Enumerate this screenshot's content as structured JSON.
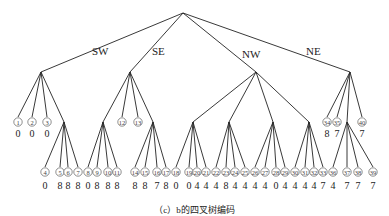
{
  "caption": "（c）b的四叉树编码",
  "root": {
    "x": 183,
    "y": 13
  },
  "level1": [
    {
      "label": "SW",
      "x": 41,
      "y": 72,
      "lx": 92,
      "ly": 55
    },
    {
      "label": "SE",
      "x": 130,
      "y": 72,
      "lx": 152,
      "ly": 55
    },
    {
      "label": "NW",
      "x": 256,
      "y": 72,
      "lx": 242,
      "ly": 58
    },
    {
      "label": "NE",
      "x": 350,
      "y": 72,
      "lx": 306,
      "ly": 55
    }
  ],
  "level2": [
    {
      "parent": 0,
      "id": "1",
      "x": 18,
      "y": 122,
      "value": "0"
    },
    {
      "parent": 0,
      "id": "2",
      "x": 32,
      "y": 122,
      "value": "0"
    },
    {
      "parent": 0,
      "id": "3",
      "x": 47,
      "y": 122,
      "value": "0"
    },
    {
      "parent": 0,
      "id": null,
      "x": 64,
      "y": 122,
      "internal": 0
    },
    {
      "parent": 1,
      "id": null,
      "x": 103,
      "y": 122,
      "internal": 1
    },
    {
      "parent": 1,
      "id": "12",
      "x": 122,
      "y": 122,
      "value": ""
    },
    {
      "parent": 1,
      "id": "13",
      "x": 138,
      "y": 122,
      "value": ""
    },
    {
      "parent": 1,
      "id": null,
      "x": 153,
      "y": 122,
      "internal": 2
    },
    {
      "parent": 2,
      "id": null,
      "x": 193,
      "y": 122,
      "internal": 3
    },
    {
      "parent": 2,
      "id": null,
      "x": 229,
      "y": 122,
      "internal": 4
    },
    {
      "parent": 2,
      "id": null,
      "x": 273,
      "y": 122,
      "internal": 5
    },
    {
      "parent": 2,
      "id": null,
      "x": 309,
      "y": 122,
      "internal": 6
    },
    {
      "parent": 3,
      "id": "34",
      "x": 327,
      "y": 122,
      "value": "8"
    },
    {
      "parent": 3,
      "id": "35",
      "x": 337,
      "y": 122,
      "value": "7"
    },
    {
      "parent": 3,
      "id": null,
      "x": 347,
      "y": 122,
      "internal": 7
    },
    {
      "parent": 3,
      "id": "40",
      "x": 362,
      "y": 122,
      "value": "7"
    }
  ],
  "level3_groups": [
    {
      "parent_x": 64,
      "leaves": [
        {
          "id": "4",
          "x": 45,
          "value": "0"
        },
        {
          "id": "5",
          "x": 60,
          "value": "8"
        },
        {
          "id": "6",
          "x": 68,
          "value": "8"
        },
        {
          "id": "7",
          "x": 78,
          "value": "8"
        }
      ]
    },
    {
      "parent_x": 103,
      "leaves": [
        {
          "id": "8",
          "x": 88,
          "value": "0"
        },
        {
          "id": "9",
          "x": 97,
          "value": "8"
        },
        {
          "id": "10",
          "x": 108,
          "value": "8"
        },
        {
          "id": "11",
          "x": 117,
          "value": "8"
        }
      ]
    },
    {
      "parent_x": 153,
      "leaves": [
        {
          "id": "14",
          "x": 135,
          "value": "8"
        },
        {
          "id": "15",
          "x": 145,
          "value": "8"
        },
        {
          "id": "16",
          "x": 157,
          "value": "7"
        },
        {
          "id": "17",
          "x": 166,
          "value": "8"
        }
      ]
    },
    {
      "parent_x": 193,
      "leaves": [
        {
          "id": "18",
          "x": 176,
          "value": "0"
        },
        {
          "id": "19",
          "x": 189,
          "value": "0"
        },
        {
          "id": "20",
          "x": 197,
          "value": "4"
        },
        {
          "id": "21",
          "x": 206,
          "value": "4"
        }
      ]
    },
    {
      "parent_x": 229,
      "leaves": [
        {
          "id": "22",
          "x": 216,
          "value": "4"
        },
        {
          "id": "23",
          "x": 226,
          "value": "8"
        },
        {
          "id": "24",
          "x": 235,
          "value": "4"
        },
        {
          "id": "25",
          "x": 245,
          "value": "4"
        }
      ]
    },
    {
      "parent_x": 273,
      "leaves": [
        {
          "id": "26",
          "x": 255,
          "value": "4"
        },
        {
          "id": "27",
          "x": 265,
          "value": "4"
        },
        {
          "id": "28",
          "x": 276,
          "value": "0"
        },
        {
          "id": "29",
          "x": 285,
          "value": "4"
        }
      ]
    },
    {
      "parent_x": 309,
      "leaves": [
        {
          "id": "30",
          "x": 295,
          "value": "4"
        },
        {
          "id": "31",
          "x": 305,
          "value": "4"
        },
        {
          "id": "32",
          "x": 314,
          "value": "4"
        },
        {
          "id": "33",
          "x": 323,
          "value": "7"
        }
      ]
    },
    {
      "parent_x": 347,
      "leaves": [
        {
          "id": "36",
          "x": 333,
          "value": "4"
        },
        {
          "id": "37",
          "x": 347,
          "value": "7"
        },
        {
          "id": "38",
          "x": 358,
          "value": "7"
        },
        {
          "id": "39",
          "x": 373,
          "value": "7"
        }
      ]
    }
  ],
  "level3_y": 172
}
